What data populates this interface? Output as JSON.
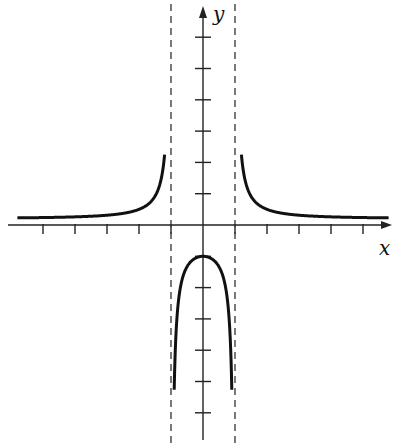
{
  "chart_data": {
    "type": "line",
    "title": "",
    "xlabel": "x",
    "ylabel": "y",
    "function": "y = 1/(x^2 - 1)",
    "xlim": [
      -5.8,
      5.8
    ],
    "ylim": [
      -6.8,
      7.0
    ],
    "grid": false,
    "legend": null,
    "x_ticks": [
      -5,
      -4,
      -3,
      -2,
      2,
      3,
      4,
      5
    ],
    "y_ticks": [
      -6,
      -5,
      -4,
      -3,
      -2,
      -1,
      1,
      2,
      3,
      4,
      5,
      6
    ],
    "vertical_asymptotes": [
      -1,
      1
    ],
    "horizontal_asymptote": 0,
    "series": [
      {
        "name": "left-branch",
        "x": [
          -5.8,
          -5,
          -4,
          -3,
          -2,
          -1.5,
          -1.2,
          -1.1,
          -1.05
        ],
        "y": [
          0.03,
          0.04,
          0.07,
          0.13,
          0.33,
          0.8,
          2.27,
          4.76,
          9.76
        ]
      },
      {
        "name": "middle-branch",
        "x": [
          -0.98,
          -0.95,
          -0.9,
          -0.8,
          -0.6,
          -0.4,
          -0.2,
          0,
          0.2,
          0.4,
          0.6,
          0.8,
          0.9,
          0.95,
          0.98
        ],
        "y": [
          -25.25,
          -10.26,
          -5.26,
          -2.78,
          -1.56,
          -1.19,
          -1.04,
          -1,
          -1.04,
          -1.19,
          -1.56,
          -2.78,
          -5.26,
          -10.26,
          -25.25
        ]
      },
      {
        "name": "right-branch",
        "x": [
          1.05,
          1.1,
          1.2,
          1.5,
          2,
          3,
          4,
          5,
          5.8
        ],
        "y": [
          9.76,
          4.76,
          2.27,
          0.8,
          0.33,
          0.13,
          0.07,
          0.04,
          0.03
        ]
      }
    ]
  },
  "labels": {
    "x": "x",
    "y": "y"
  },
  "layout": {
    "origin_px": [
      203,
      225
    ],
    "unit_px_x": 32,
    "unit_px_y": 31.3
  }
}
